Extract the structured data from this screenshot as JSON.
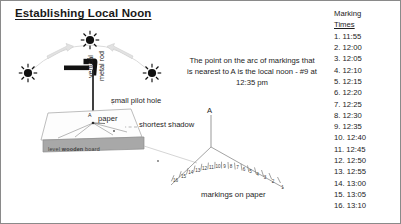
{
  "title": "Establishing Local Noon",
  "note": "The point on the arc of markings that is nearest to A is the local noon - #9 at 12:35 pm",
  "labels": {
    "vertical": "vertical",
    "metal_rod": "metal rod",
    "pilot_hole": "small pilot hole",
    "paper": "paper",
    "shortest_shadow": "shortest shadow",
    "board_prefix": "level ",
    "board_bold": "wooden",
    "board_suffix": " board",
    "markings_on_paper": "markings on paper",
    "point_a_board": "A",
    "point_a_arc": "A"
  },
  "times_panel": {
    "header_line1": "Marking",
    "header_line2": "Times",
    "entries": [
      "1. 11:55",
      "2. 12:00",
      "3. 12:05",
      "4. 12:10",
      "5. 12:15",
      "6. 12:20",
      "7. 12:25",
      "8. 12:30",
      "9. 12:35",
      "10. 12:40",
      "11. 12:45",
      "12. 12:50",
      "13. 12:55",
      "14. 13:00",
      "15. 13:05",
      "16. 13:10"
    ]
  },
  "arc_marks": {
    "numbers": [
      "1",
      "2",
      "3",
      "4",
      "5",
      "6",
      "7",
      "8",
      "9",
      "10",
      "11",
      "12",
      "13",
      "14",
      "15",
      "16"
    ]
  },
  "icons": {
    "sun_left": "sun-icon",
    "sun_top": "sun-icon",
    "sun_right": "sun-icon",
    "hammer": "hammer-icon",
    "arrow_left": "arrow-icon",
    "arrow_right": "arrow-icon"
  },
  "colors": {
    "ink": "#1a1a1a",
    "board_gray": "#a6a6a6",
    "line_gray": "#8f8f8f",
    "arrow_gray": "#d9d9d9",
    "border": "#8a8a8a"
  }
}
